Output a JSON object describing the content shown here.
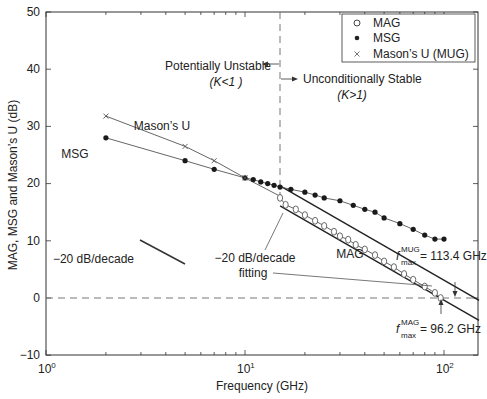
{
  "chart_data": {
    "type": "scatter",
    "title": "",
    "xlabel": "Frequency (GHz)",
    "ylabel": "MAG, MSG and Mason's U (dB)",
    "xscale": "log",
    "xlim": [
      1,
      150
    ],
    "ylim": [
      -10,
      50
    ],
    "xticks": [
      "10^0",
      "10^1",
      "10^2"
    ],
    "yticks": [
      -10,
      0,
      10,
      20,
      30,
      40,
      50
    ],
    "grid": false,
    "legend_position": "upper right",
    "series": [
      {
        "name": "MAG",
        "marker": "open-circle",
        "x": [
          15,
          16,
          18,
          20,
          22.5,
          25,
          28,
          30,
          33,
          36,
          40,
          45,
          50,
          56,
          63,
          70,
          80,
          90,
          96.2
        ],
        "y": [
          17.5,
          16.3,
          15.5,
          14.5,
          13.5,
          12.6,
          11.6,
          10.8,
          10.2,
          9.3,
          8.5,
          7.5,
          6.4,
          5.4,
          4.2,
          3.2,
          2,
          0.9,
          0
        ]
      },
      {
        "name": "MSG",
        "marker": "filled-circle",
        "x": [
          2,
          5,
          7,
          10,
          11,
          12,
          13,
          14,
          15,
          17,
          20,
          22.5,
          25,
          30,
          35,
          40,
          45,
          50,
          60,
          70,
          80,
          90,
          100
        ],
        "y": [
          28,
          24,
          22.5,
          21,
          20.7,
          20.3,
          20,
          19.7,
          19.4,
          19,
          18.5,
          18,
          17.5,
          17,
          16.2,
          15.5,
          15,
          14,
          13,
          12,
          11,
          10.3,
          10.3
        ]
      },
      {
        "name": "Mason's U (MUG)",
        "marker": "x",
        "x": [
          2,
          5,
          7,
          10
        ],
        "y": [
          31.8,
          26.5,
          24,
          21
        ]
      }
    ],
    "fit_lines": [
      {
        "name": "MUG -20 dB/decade fit",
        "x": [
          15,
          150
        ],
        "y": [
          19.6,
          -0.4
        ],
        "fmax": "113.4 GHz"
      },
      {
        "name": "MAG -20 dB/decade fit",
        "x": [
          15,
          150
        ],
        "y": [
          16.1,
          -3.9
        ],
        "fmax": "96.2 GHz"
      }
    ],
    "annotations": [
      "Potentially Unstable (K<1)",
      "Unconditionally Stable (K>1)",
      "Mason's U",
      "MSG",
      "MAG",
      "-20 dB/decade",
      "-20 dB/decade fitting",
      "f_max^MUG = 113.4 GHz",
      "f_max^MAG = 96.2 GHz"
    ],
    "reference_lines": [
      {
        "type": "vertical-dashed",
        "x": 15
      },
      {
        "type": "horizontal-dashed",
        "y": 0
      }
    ]
  },
  "axes": {
    "xlabel": "Frequency (GHz)",
    "ylabel": "MAG, MSG and Mason’s U (dB)",
    "yticks": [
      "50",
      "40",
      "30",
      "20",
      "10",
      "0",
      "−10"
    ],
    "xtick_base": "10",
    "xtick_exps": [
      "0",
      "1",
      "2"
    ]
  },
  "legend": {
    "items": [
      {
        "label": "MAG"
      },
      {
        "label": "MSG"
      },
      {
        "label": "Mason’s U (MUG)"
      }
    ]
  },
  "annotations": {
    "unstable_line1": "Potentially Unstable",
    "unstable_line2": "(K<1 )",
    "stable_line1": "Unconditionally Stable",
    "stable_line2": "(K>1)",
    "masons_u": "Mason’s U",
    "msg": "MSG",
    "mag": "MAG",
    "slope_ref": "−20 dB/decade",
    "slope_fit_line1": "−20 dB/decade",
    "slope_fit_line2": "fitting",
    "fmax_mug_f": "f",
    "fmax_mug_sup": "MUG",
    "fmax_mug_sub": "max",
    "fmax_mug_value": "= 113.4 GHz",
    "fmax_mag_f": "f",
    "fmax_mag_sup": "MAG",
    "fmax_mag_sub": "max",
    "fmax_mag_value": "= 96.2 GHz"
  }
}
